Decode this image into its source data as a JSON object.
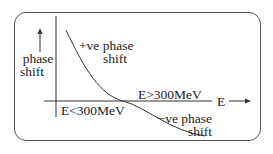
{
  "diagram": {
    "y_axis_label_line1": "phase",
    "y_axis_label_line2": "shift",
    "x_axis_label": "E",
    "region_positive_line1": "+ve phase",
    "region_positive_line2": "shift",
    "region_negative_line1": "−ve phase",
    "region_negative_line2": "shift",
    "low_energy_label": "E<300MeV",
    "high_energy_label": "E>300MeV",
    "colors": {
      "line": "#333333",
      "text": "#222222",
      "frame": "#555555"
    }
  }
}
